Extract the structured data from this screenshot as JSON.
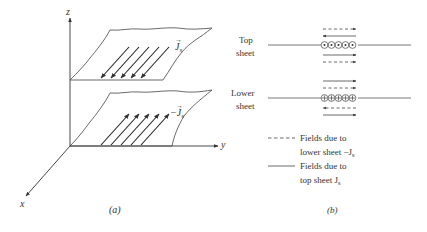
{
  "panel_a": {
    "caption": "(a)",
    "axes": {
      "x": "x",
      "y": "y",
      "z": "z"
    },
    "top_sheet_label": "J",
    "top_sheet_sub": "s",
    "lower_sheet_label": "−J",
    "lower_sheet_sub": "s"
  },
  "panel_b": {
    "caption": "(b)",
    "top_label_line1": "Top",
    "top_label_line2": "sheet",
    "lower_label_line1": "Lower",
    "lower_label_line2": "sheet",
    "legend": {
      "dashed_line1": "Fields due to",
      "dashed_line2": "lower sheet −J",
      "dashed_sub": "s",
      "solid_line1": "Fields due to",
      "solid_line2": "top sheet J",
      "solid_sub": "s"
    }
  },
  "colors": {
    "stroke": "#333333",
    "background": "#ffffff"
  }
}
